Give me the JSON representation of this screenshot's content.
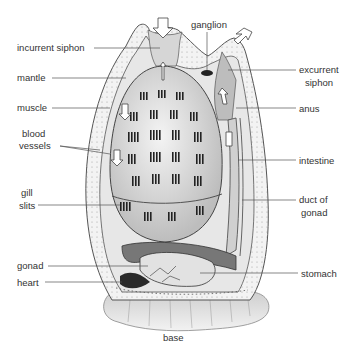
{
  "figure": {
    "colors": {
      "ink": "#333333",
      "line": "#555555",
      "tunic": "#eeeeee",
      "body": "#d8d8d8",
      "shadow": "#444444"
    }
  },
  "labels": {
    "incurrent_siphon": "incurrent siphon",
    "mantle": "mantle",
    "muscle": "muscle",
    "blood": "blood",
    "vessels": "vessels",
    "gill": "gill",
    "slits": "slits",
    "gonad": "gonad",
    "heart": "heart",
    "ganglion": "ganglion",
    "excurrent": "excurrent",
    "siphon": "siphon",
    "anus": "anus",
    "intestine": "intestine",
    "duct_of": "duct of",
    "gonad_r": "gonad",
    "stomach": "stomach",
    "base": "base"
  }
}
